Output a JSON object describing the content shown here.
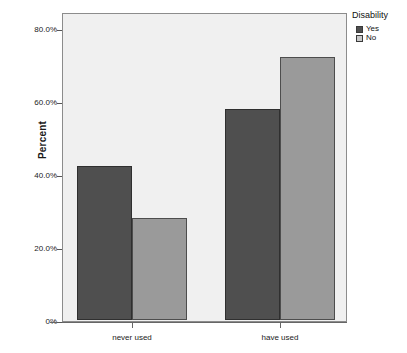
{
  "chart_data": {
    "type": "bar",
    "title": "",
    "xlabel": "",
    "ylabel": "Percent",
    "categories": [
      "never used",
      "have used"
    ],
    "series": [
      {
        "name": "Yes",
        "color": "#4f4f4f",
        "values": [
          42.2,
          57.7
        ]
      },
      {
        "name": "No",
        "color": "#9a9a9a",
        "values": [
          28.0,
          72.0
        ]
      }
    ],
    "ylim": [
      0,
      80
    ],
    "ytick_values": [
      80,
      60,
      40,
      20,
      0
    ],
    "ytick_labels": [
      "80.0%",
      "60.0%",
      "40.0%",
      "20.0%",
      "0%"
    ],
    "grid": false,
    "legend": {
      "title": "Disability",
      "position": "right-top",
      "entries": [
        {
          "label": "Yes",
          "swatch": "yes"
        },
        {
          "label": "No",
          "swatch": "no"
        }
      ]
    },
    "plot_background": "#f0f0f0",
    "frame_color": "#8c8c8c"
  }
}
